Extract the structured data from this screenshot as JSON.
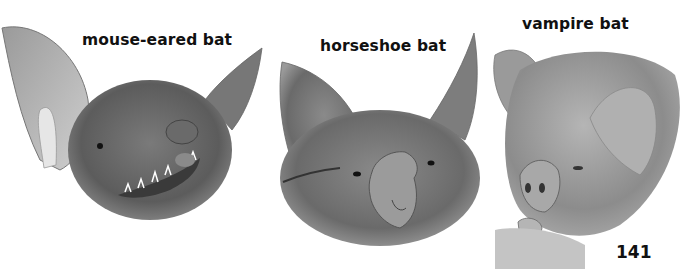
{
  "labels": {
    "mouse_eared": "mouse-eared bat",
    "horseshoe": "horseshoe bat",
    "vampire": "vampire bat"
  },
  "page_number": "141",
  "illustrations": [
    {
      "name": "mouse-eared bat head",
      "style": "grayscale pencil drawing"
    },
    {
      "name": "horseshoe bat head",
      "style": "grayscale pencil drawing"
    },
    {
      "name": "vampire bat head",
      "style": "grayscale pencil drawing"
    }
  ]
}
